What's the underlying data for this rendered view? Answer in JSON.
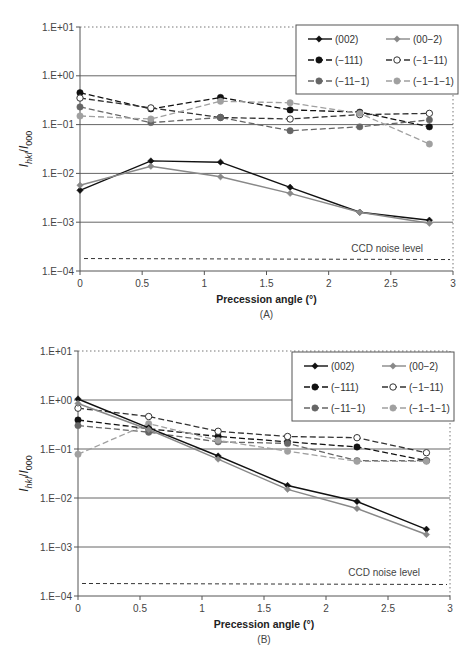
{
  "chart_data": [
    {
      "panel": "A",
      "type": "line",
      "title": "",
      "caption": "(A)",
      "xlabel": "Precession angle (°)",
      "ylabel": "I_hkl/I_000",
      "yscale": "log",
      "xlim": [
        0,
        3
      ],
      "ylim": [
        0.0001,
        10
      ],
      "xticks": [
        "0",
        "0.5",
        "1",
        "1.5",
        "2",
        "2.5",
        "3"
      ],
      "yticks": [
        "1.E+01",
        "1.E+00",
        "1.E−01",
        "1.E−02",
        "1.E−03",
        "1.E−04"
      ],
      "grid": "horizontal",
      "legend_position": "top-right",
      "annotation": "CCD noise level",
      "noise_level": 0.00018,
      "x": [
        0,
        0.57,
        1.13,
        1.69,
        2.25,
        2.81
      ],
      "series": [
        {
          "name": "(002)",
          "values": [
            0.0045,
            0.018,
            0.017,
            0.0052,
            0.0016,
            0.0011
          ],
          "color": "#111111",
          "dash": "solid",
          "marker": "diamond-filled"
        },
        {
          "name": "(00−2)",
          "values": [
            0.0057,
            0.014,
            0.0085,
            0.0039,
            0.0016,
            0.00095
          ],
          "color": "#888888",
          "dash": "solid",
          "marker": "diamond-filled"
        },
        {
          "name": "(−111)",
          "values": [
            0.45,
            0.21,
            0.36,
            0.2,
            0.18,
            0.09
          ],
          "color": "#111111",
          "dash": "dashed",
          "marker": "circle-filled"
        },
        {
          "name": "(−1−11)",
          "values": [
            0.35,
            0.22,
            0.14,
            0.13,
            0.16,
            0.17
          ],
          "color": "#333333",
          "dash": "dashed",
          "marker": "circle-open"
        },
        {
          "name": "(−11−1)",
          "values": [
            0.23,
            0.11,
            0.14,
            0.075,
            0.09,
            0.125
          ],
          "color": "#666666",
          "dash": "dashed",
          "marker": "circle-filled"
        },
        {
          "name": "(−1−1−1)",
          "values": [
            0.15,
            0.13,
            0.3,
            0.28,
            0.17,
            0.04
          ],
          "color": "#a0a0a0",
          "dash": "dashed",
          "marker": "circle-filled"
        }
      ]
    },
    {
      "panel": "B",
      "type": "line",
      "title": "",
      "caption": "(B)",
      "xlabel": "Precession angle (°)",
      "ylabel": "I_hkl/I_000",
      "yscale": "log",
      "xlim": [
        0,
        3
      ],
      "ylim": [
        0.0001,
        10
      ],
      "xticks": [
        "0",
        "0.5",
        "1",
        "1.5",
        "2",
        "2.5",
        "3"
      ],
      "yticks": [
        "1.E+01",
        "1.E+00",
        "1.E−01",
        "1.E−02",
        "1.E−03",
        "1.E−04"
      ],
      "grid": "horizontal",
      "legend_position": "top-right",
      "annotation": "CCD noise level",
      "noise_level": 0.00018,
      "x": [
        0,
        0.57,
        1.13,
        1.69,
        2.25,
        2.81
      ],
      "series": [
        {
          "name": "(002)",
          "values": [
            1.05,
            0.27,
            0.072,
            0.018,
            0.0085,
            0.0023
          ],
          "color": "#111111",
          "dash": "solid",
          "marker": "diamond-filled"
        },
        {
          "name": "(00−2)",
          "values": [
            0.85,
            0.25,
            0.062,
            0.015,
            0.0061,
            0.0018
          ],
          "color": "#888888",
          "dash": "solid",
          "marker": "diamond-filled"
        },
        {
          "name": "(−111)",
          "values": [
            0.39,
            0.26,
            0.18,
            0.14,
            0.11,
            0.058
          ],
          "color": "#111111",
          "dash": "dashed",
          "marker": "circle-filled"
        },
        {
          "name": "(−1−11)",
          "values": [
            0.68,
            0.46,
            0.23,
            0.18,
            0.17,
            0.084
          ],
          "color": "#333333",
          "dash": "dashed",
          "marker": "circle-open"
        },
        {
          "name": "(−11−1)",
          "values": [
            0.3,
            0.22,
            0.14,
            0.13,
            0.058,
            0.058
          ],
          "color": "#666666",
          "dash": "dashed",
          "marker": "circle-filled"
        },
        {
          "name": "(−1−1−1)",
          "values": [
            0.078,
            0.33,
            0.15,
            0.09,
            0.056,
            0.056
          ],
          "color": "#a0a0a0",
          "dash": "dashed",
          "marker": "circle-filled"
        }
      ]
    }
  ]
}
